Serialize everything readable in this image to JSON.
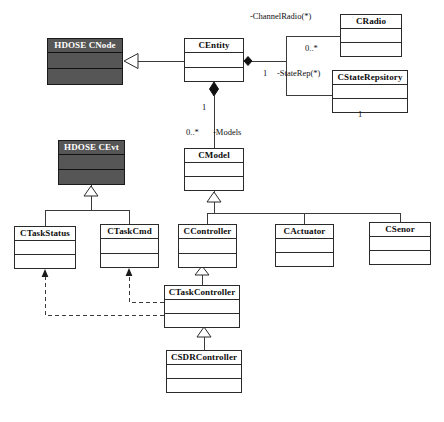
{
  "diagram": {
    "kind": "uml-class-diagram",
    "caption": "",
    "classes": [
      {
        "id": "hdose_cnode",
        "name": "HDOSE CNode",
        "style": "shaded",
        "x": 47,
        "y": 38,
        "w": 76,
        "h": 47,
        "name_h": 14
      },
      {
        "id": "centity",
        "name": "CEntity",
        "style": "plain",
        "x": 184,
        "y": 38,
        "w": 60,
        "h": 44,
        "name_h": 14
      },
      {
        "id": "cradio",
        "name": "CRadio",
        "style": "plain",
        "x": 340,
        "y": 14,
        "w": 62,
        "h": 43,
        "name_h": 14
      },
      {
        "id": "cstaterepsitory",
        "name": "CStateRepsitory",
        "style": "plain",
        "x": 332,
        "y": 70,
        "w": 76,
        "h": 43,
        "name_h": 14
      },
      {
        "id": "hdose_cevt",
        "name": "HDOSE CEvt",
        "style": "shaded",
        "x": 58,
        "y": 140,
        "w": 67,
        "h": 45,
        "name_h": 14
      },
      {
        "id": "cmodel",
        "name": "CModel",
        "style": "plain",
        "x": 184,
        "y": 148,
        "w": 60,
        "h": 43,
        "name_h": 14
      },
      {
        "id": "ctaskstatus",
        "name": "CTaskStatus",
        "style": "plain",
        "x": 14,
        "y": 226,
        "w": 62,
        "h": 43,
        "name_h": 14
      },
      {
        "id": "ctaskcmd",
        "name": "CTaskCmd",
        "style": "plain",
        "x": 100,
        "y": 224,
        "w": 59,
        "h": 44,
        "name_h": 14
      },
      {
        "id": "ccontroller",
        "name": "CController",
        "style": "plain",
        "x": 178,
        "y": 224,
        "w": 59,
        "h": 44,
        "name_h": 14
      },
      {
        "id": "cactuator",
        "name": "CActuator",
        "style": "plain",
        "x": 275,
        "y": 224,
        "w": 59,
        "h": 43,
        "name_h": 14
      },
      {
        "id": "csenor",
        "name": "CSenor",
        "style": "plain",
        "x": 369,
        "y": 222,
        "w": 62,
        "h": 43,
        "name_h": 14
      },
      {
        "id": "ctaskcontroller",
        "name": "CTaskController",
        "style": "plain",
        "x": 164,
        "y": 285,
        "w": 76,
        "h": 43,
        "name_h": 14
      },
      {
        "id": "csdrcontroller",
        "name": "CSDRController",
        "style": "plain",
        "x": 166,
        "y": 350,
        "w": 76,
        "h": 43,
        "name_h": 14
      }
    ],
    "edge_labels": [
      {
        "id": "lbl_channelradio",
        "text": "-ChannelRadio(*)",
        "x": 250,
        "y": 12
      },
      {
        "id": "lbl_radio_mult",
        "text": "0..*",
        "x": 305,
        "y": 44
      },
      {
        "id": "lbl_entity_mult",
        "text": "1",
        "x": 263,
        "y": 69
      },
      {
        "id": "lbl_staterep",
        "text": "-StateRep(*)",
        "x": 277,
        "y": 69
      },
      {
        "id": "lbl_staterep_one",
        "text": "1",
        "x": 358,
        "y": 110
      },
      {
        "id": "lbl_models_one",
        "text": "1",
        "x": 202,
        "y": 103
      },
      {
        "id": "lbl_models_many",
        "text": "0..*",
        "x": 186,
        "y": 128
      },
      {
        "id": "lbl_models",
        "text": "-Models",
        "x": 213,
        "y": 128
      }
    ],
    "relationships": [
      {
        "id": "gen_centity_to_cnode",
        "type": "generalization",
        "from": "centity",
        "to": "hdose_cnode"
      },
      {
        "id": "comp_centity_cradio",
        "type": "composition",
        "from": "centity",
        "to": "cradio",
        "label": "-ChannelRadio(*)",
        "source_mult": "1",
        "target_mult": "0..*"
      },
      {
        "id": "comp_centity_cstaterep",
        "type": "composition",
        "from": "centity",
        "to": "cstaterepsitory",
        "label": "-StateRep(*)",
        "source_mult": "1",
        "target_mult": "1"
      },
      {
        "id": "comp_centity_cmodel",
        "type": "composition",
        "from": "centity",
        "to": "cmodel",
        "label": "-Models",
        "source_mult": "1",
        "target_mult": "0..*"
      },
      {
        "id": "gen_ctaskstatus_to_cevt",
        "type": "generalization",
        "from": "ctaskstatus",
        "to": "hdose_cevt"
      },
      {
        "id": "gen_ctaskcmd_to_cevt",
        "type": "generalization",
        "from": "ctaskcmd",
        "to": "hdose_cevt"
      },
      {
        "id": "gen_ccontroller_to_cmodel",
        "type": "generalization",
        "from": "ccontroller",
        "to": "cmodel"
      },
      {
        "id": "gen_cactuator_to_cmodel",
        "type": "generalization",
        "from": "cactuator",
        "to": "cmodel"
      },
      {
        "id": "gen_csenor_to_cmodel",
        "type": "generalization",
        "from": "csenor",
        "to": "cmodel"
      },
      {
        "id": "gen_ctaskctrl_to_cctrl",
        "type": "generalization",
        "from": "ctaskcontroller",
        "to": "ccontroller"
      },
      {
        "id": "gen_csdrctrl_to_ctaskctrl",
        "type": "generalization",
        "from": "csdrcontroller",
        "to": "ctaskcontroller"
      },
      {
        "id": "dep_ctaskctrl_ctaskcmd",
        "type": "dependency",
        "from": "ctaskcontroller",
        "to": "ctaskcmd"
      },
      {
        "id": "dep_ctaskctrl_ctaskstatus",
        "type": "dependency",
        "from": "ctaskcontroller",
        "to": "ctaskstatus"
      }
    ]
  }
}
